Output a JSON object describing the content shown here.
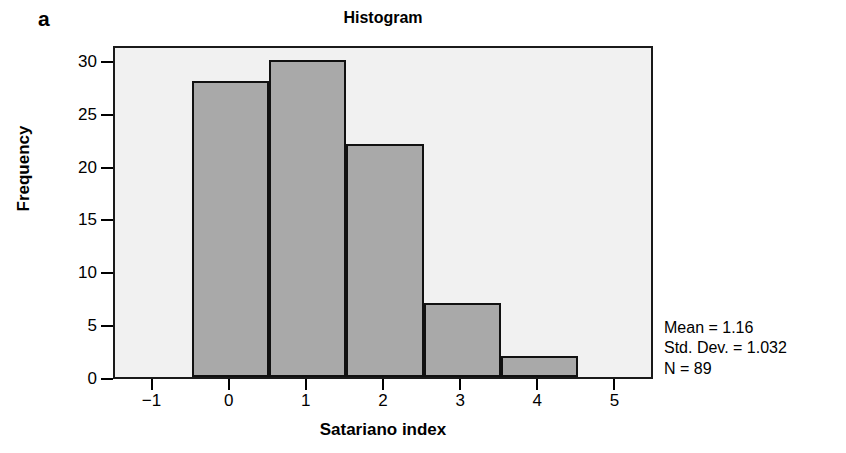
{
  "panel": {
    "label": "a"
  },
  "chart_data": {
    "type": "bar",
    "title": "Histogram",
    "xlabel": "Satariano index",
    "ylabel": "Frequency",
    "categories": [
      "0",
      "1",
      "2",
      "3",
      "4"
    ],
    "bin_centers": [
      0,
      1,
      2,
      3,
      4
    ],
    "bin_edges": [
      -0.5,
      0.5,
      1.5,
      2.5,
      3.5,
      4.5
    ],
    "values": [
      28,
      30,
      22,
      7,
      2
    ],
    "xlim": [
      -1.5,
      5.5
    ],
    "ylim": [
      0,
      31.5
    ],
    "xticks": [
      "−1",
      "0",
      "1",
      "2",
      "3",
      "4",
      "5"
    ],
    "xtick_values": [
      -1,
      0,
      1,
      2,
      3,
      4,
      5
    ],
    "yticks": [
      "0",
      "5",
      "10",
      "15",
      "20",
      "25",
      "30"
    ],
    "ytick_values": [
      0,
      5,
      10,
      15,
      20,
      25,
      30
    ],
    "grid": false,
    "legend": false,
    "bar_fill_color": "#a9a9a9",
    "bar_edge_color": "#111111",
    "plot_background_color": "#f1f1f1",
    "annotations": [
      "Mean = 1.16",
      "Std. Dev. = 1.032",
      "N = 89"
    ]
  },
  "stats": {
    "mean": "Mean = 1.16",
    "std_dev": "Std. Dev. = 1.032",
    "n": "N = 89"
  }
}
